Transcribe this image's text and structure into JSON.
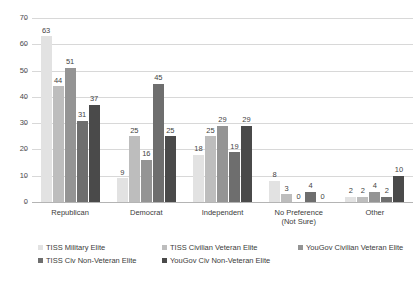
{
  "chart_data": {
    "type": "bar",
    "title": "",
    "xlabel": "",
    "ylabel": "",
    "ylim": [
      0,
      70
    ],
    "yticks": [
      70,
      60,
      50,
      40,
      30,
      20,
      10,
      0
    ],
    "grid": true,
    "legend_position": "bottom",
    "categories": [
      "Republican",
      "Democrat",
      "Independent",
      "No Preference",
      "Other"
    ],
    "category_sublabels": [
      "",
      "",
      "",
      "(Not Sure)",
      ""
    ],
    "series": [
      {
        "name": "TISS Military Elite",
        "color": "#e2e2e2",
        "values": [
          63,
          9,
          18,
          8,
          2
        ]
      },
      {
        "name": "TISS Civilian Veteran Elite",
        "color": "#bdbdbd",
        "values": [
          44,
          25,
          25,
          3,
          2
        ]
      },
      {
        "name": "YouGov Civilian Veteran Elite",
        "color": "#949494",
        "values": [
          51,
          16,
          29,
          0,
          4
        ]
      },
      {
        "name": "TISS Civ Non-Veteran Elite",
        "color": "#6e6e6e",
        "values": [
          31,
          45,
          19,
          4,
          2
        ]
      },
      {
        "name": "YouGov Civ Non-Veteran Elite",
        "color": "#4a4a4a",
        "values": [
          37,
          25,
          29,
          0,
          10
        ]
      }
    ]
  }
}
